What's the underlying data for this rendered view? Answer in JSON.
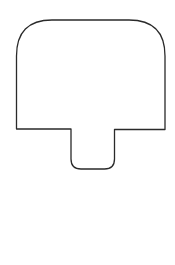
{
  "diagram": {
    "shape": {
      "name": "mushroom-shape",
      "stroke_color": "#2a2a2a",
      "fill_color": "#ffffff",
      "stroke_width": 1.3
    }
  }
}
